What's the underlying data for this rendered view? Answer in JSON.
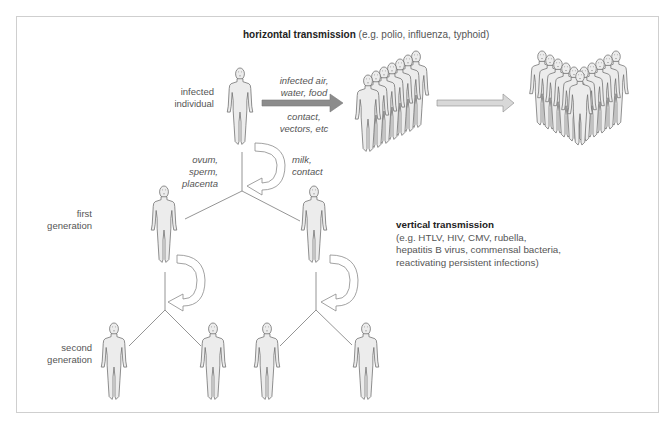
{
  "diagram": {
    "horizontal": {
      "title": "horizontal transmission",
      "examples": "(e.g. polio, influenza, typhoid)",
      "routes_above": [
        "infected air,",
        "water, food"
      ],
      "routes_below": [
        "contact,",
        "vectors, etc"
      ]
    },
    "vertical": {
      "title": "vertical transmission",
      "examples": [
        "(e.g. HTLV, HIV, CMV, rubella,",
        "hepatitis B virus, commensal bacteria,",
        "reactivating persistent infections)"
      ]
    },
    "labels": {
      "infected": [
        "infected",
        "individual"
      ],
      "first_generation": [
        "first",
        "generation"
      ],
      "second_generation": [
        "second",
        "generation"
      ],
      "germline_route": [
        "ovum,",
        "sperm,",
        "placenta"
      ],
      "postnatal_route": [
        "milk,",
        "contact"
      ]
    },
    "icons": {
      "person": "human-figure-icon",
      "crowd": "crowd-icon",
      "arrow": "arrow-right-icon",
      "curved_arrow": "curved-arrow-icon"
    },
    "colors": {
      "dark_arrow": "#8c8c8c",
      "light_arrow": "#d8d8d8",
      "figure_fill": "#ececec",
      "figure_stroke": "#6f6f6f",
      "line": "#7a7a7a",
      "frame": "#cfcfcf"
    }
  }
}
